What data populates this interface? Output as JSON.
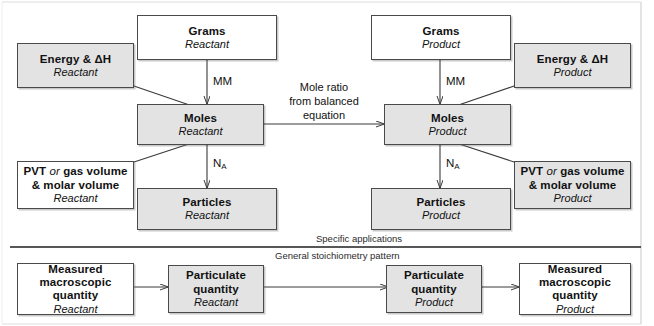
{
  "figure": {
    "kind": "stoichiometry-flow-diagram",
    "frame_color": "#b8b8b8",
    "box_border_color": "#4a4a4a",
    "shaded_fill": "#e3e3e3",
    "plain_fill": "#ffffff",
    "arrow_color": "#3a3a3a"
  },
  "nodes": {
    "grams_reactant": {
      "title": "Grams",
      "subtitle": "Reactant"
    },
    "grams_product": {
      "title": "Grams",
      "subtitle": "Product"
    },
    "moles_reactant": {
      "title": "Moles",
      "subtitle": "Reactant"
    },
    "moles_product": {
      "title": "Moles",
      "subtitle": "Product"
    },
    "particles_reactant": {
      "title": "Particles",
      "subtitle": "Reactant"
    },
    "particles_product": {
      "title": "Particles",
      "subtitle": "Product"
    },
    "energy_reactant": {
      "title": "Energy & ΔH",
      "subtitle": "Reactant"
    },
    "energy_product": {
      "title": "Energy & ΔH",
      "subtitle": "Product"
    },
    "pvt_reactant": {
      "title_a": "PVT ",
      "title_or": "or",
      "title_b": " gas volume",
      "title_line2": "& molar volume",
      "subtitle": "Reactant"
    },
    "pvt_product": {
      "title_a": "PVT ",
      "title_or": "or",
      "title_b": " gas volume",
      "title_line2": "& molar volume",
      "subtitle": "Product"
    },
    "measured_reactant": {
      "line1": "Measured",
      "line2": "macroscopic",
      "line3": "quantity",
      "subtitle": "Reactant"
    },
    "measured_product": {
      "line1": "Measured",
      "line2": "macroscopic",
      "line3": "quantity",
      "subtitle": "Product"
    },
    "particulate_reactant": {
      "line1": "Particulate",
      "line2": "quantity",
      "subtitle": "Reactant"
    },
    "particulate_product": {
      "line1": "Particulate",
      "line2": "quantity",
      "subtitle": "Product"
    }
  },
  "edge_labels": {
    "mm_reactant": "MM",
    "mm_product": "MM",
    "na_reactant_prefix": "N",
    "na_reactant_sub": "A",
    "na_product_prefix": "N",
    "na_product_sub": "A",
    "mole_ratio_line1": "Mole ratio",
    "mole_ratio_line2": "from balanced",
    "mole_ratio_line3": "equation"
  },
  "sections": {
    "specific_applications": "Specific applications",
    "general_pattern": "General stoichiometry pattern"
  }
}
